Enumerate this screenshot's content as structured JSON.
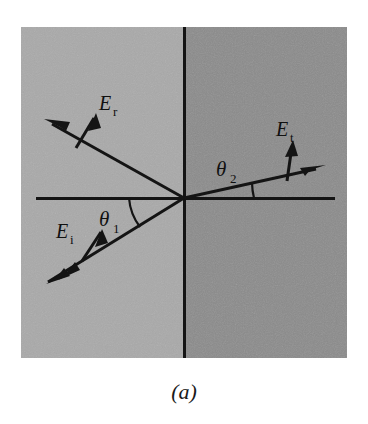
{
  "figure": {
    "caption": "(a)",
    "panel": {
      "left_medium_color": "#a9a9a9",
      "right_medium_color": "#8b8b8b",
      "line_color": "#141414",
      "background_color": "#ffffff",
      "x": 21,
      "y": 27,
      "width": 326,
      "height": 331
    },
    "interface": {
      "name": "interface-line",
      "x": 184,
      "y_top": 27,
      "y_bottom": 358
    },
    "axis": {
      "name": "surface-axis-line",
      "y": 198,
      "x_left": 36,
      "x_right": 335
    },
    "origin": {
      "x": 184,
      "y": 198
    },
    "rays": [
      {
        "id": "incident",
        "label": "E",
        "subscript": "i",
        "label_x": 68,
        "label_y": 232,
        "from": {
          "x": 48,
          "y": 282
        },
        "to": {
          "x": 184,
          "y": 198
        },
        "arrowheads": 2,
        "arrow_at": "from",
        "field_arrow": {
          "x1": 82,
          "y1": 260,
          "x2": 100,
          "y2": 233
        }
      },
      {
        "id": "reflected",
        "label": "E",
        "subscript": "r",
        "label_x": 103,
        "label_y": 104,
        "from": {
          "x": 184,
          "y": 198
        },
        "to": {
          "x": 45,
          "y": 120
        },
        "arrowheads": 1,
        "arrow_at": "to",
        "field_arrow": {
          "x1": 76,
          "y1": 147,
          "x2": 93,
          "y2": 117
        }
      },
      {
        "id": "transmitted",
        "label": "E",
        "subscript": "t",
        "label_x": 283,
        "label_y": 130,
        "from": {
          "x": 184,
          "y": 198
        },
        "to": {
          "x": 323,
          "y": 167
        },
        "arrowheads": 1,
        "arrow_at": "to",
        "field_arrow": {
          "x1": 287,
          "y1": 180,
          "x2": 291,
          "y2": 145
        }
      }
    ],
    "angles": [
      {
        "id": "theta1",
        "label": "θ",
        "subscript": "1",
        "label_x": 109,
        "label_y": 221,
        "arc_from": {
          "x": 129,
          "y": 198
        },
        "arc_to": {
          "x": 139,
          "y": 226
        },
        "arc_radius": 55,
        "description": "angle of incidence between incident ray and surface axis"
      },
      {
        "id": "theta2",
        "label": "θ",
        "subscript": "2",
        "label_x": 225,
        "label_y": 171,
        "arc_from": {
          "x": 253,
          "y": 183
        },
        "arc_to": {
          "x": 250,
          "y": 198
        },
        "arc_radius": 70,
        "description": "angle of refraction between transmitted ray and surface axis"
      }
    ]
  }
}
